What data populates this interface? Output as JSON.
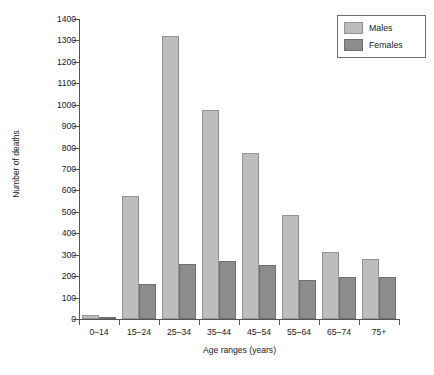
{
  "chart_data": {
    "type": "bar",
    "title": "",
    "xlabel": "Age ranges (years)",
    "ylabel": "Number of deaths",
    "categories": [
      "0–14",
      "15–24",
      "25–34",
      "35–44",
      "45–54",
      "55–64",
      "65–74",
      "75+"
    ],
    "series": [
      {
        "name": "Males",
        "color": "#bdbdbd",
        "values": [
          18,
          572,
          1320,
          975,
          775,
          487,
          315,
          278
        ]
      },
      {
        "name": "Females",
        "color": "#8c8c8c",
        "values": [
          8,
          162,
          258,
          272,
          252,
          183,
          198,
          195
        ]
      }
    ],
    "ylim": [
      0,
      1400
    ],
    "yticks": [
      0,
      100,
      200,
      300,
      400,
      500,
      600,
      700,
      800,
      900,
      1000,
      1100,
      1200,
      1300,
      1400
    ],
    "ytick_labels": [
      "0",
      "100",
      "200",
      "300",
      "400",
      "500",
      "600",
      "700",
      "800",
      "900",
      "1000",
      "1100",
      "1200",
      "1300",
      "1400"
    ],
    "grid": false,
    "legend_position": "top-right",
    "legend_entries": [
      "Males",
      "Females"
    ]
  },
  "axes": {
    "y_title": "Number of deaths",
    "x_title": "Age ranges (years)"
  },
  "legend": {
    "items": [
      {
        "label": "Males"
      },
      {
        "label": "Females"
      }
    ]
  },
  "colors": {
    "males": "#bdbdbd",
    "females": "#8c8c8c",
    "axis": "#555555",
    "text": "#1a1a1a",
    "background": "#ffffff",
    "legend_border": "#6e6e6e"
  }
}
